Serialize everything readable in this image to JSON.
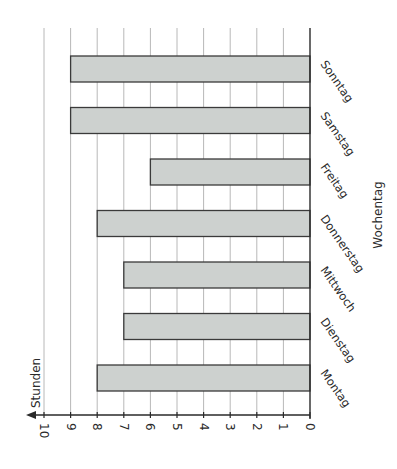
{
  "chart_data": {
    "type": "bar",
    "orientation": "horizontal (page rotated 90° clockwise)",
    "categories": [
      "Montag",
      "Dienstag",
      "Mittwoch",
      "Donnerstag",
      "Freitag",
      "Samstag",
      "Sonntag"
    ],
    "values": [
      8,
      7,
      7,
      8,
      6,
      9,
      9
    ],
    "title": "",
    "xlabel": "Wochentag",
    "ylabel": "Stunden",
    "ylim": [
      0,
      10
    ],
    "yticks": [
      0,
      1,
      2,
      3,
      4,
      5,
      6,
      7,
      8,
      9,
      10
    ],
    "grid": true,
    "legend": null
  },
  "colors": {
    "bar_fill": "#cdd1cf",
    "bar_stroke": "#3a3a3a",
    "grid": "#b8b8b8",
    "axis": "#2a2a2a",
    "text": "#2a2a2a"
  }
}
